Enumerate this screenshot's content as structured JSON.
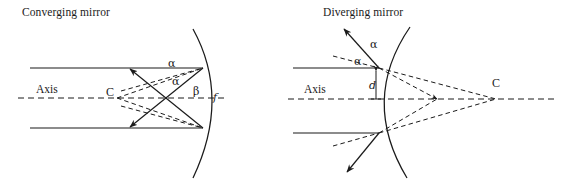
{
  "figure": {
    "background_color": "#ffffff",
    "ink_color": "#1b1b1b",
    "width": 565,
    "height": 187
  },
  "panels": {
    "left": {
      "title": "Converging mirror",
      "axis_label": "Axis",
      "center_label": "C",
      "focus_label": "f",
      "angle_incident_label": "α",
      "angle_normal_label": "α",
      "angle_beta_label": "β",
      "mirror_type": "concave",
      "rays": [
        {
          "name": "upper-parallel-ray",
          "style": "solid",
          "from_x": 30,
          "from_y": 68,
          "to_x": 202,
          "to_y": 68
        },
        {
          "name": "lower-parallel-ray",
          "style": "solid",
          "from_x": 30,
          "from_y": 128,
          "to_x": 202,
          "to_y": 128
        },
        {
          "name": "upper-reflected-ray",
          "style": "solid",
          "from_x": 202,
          "from_y": 68,
          "to_x": 131,
          "to_y": 125
        },
        {
          "name": "lower-reflected-ray",
          "style": "solid",
          "from_x": 202,
          "from_y": 128,
          "to_x": 131,
          "to_y": 71
        },
        {
          "name": "upper-radius-dashed",
          "style": "dashed",
          "from_x": 202,
          "from_y": 68,
          "to_x": 117,
          "to_y": 98
        },
        {
          "name": "lower-radius-dashed",
          "style": "dashed",
          "from_x": 202,
          "from_y": 128,
          "to_x": 117,
          "to_y": 98
        },
        {
          "name": "upper-focus-dashed",
          "style": "dashed",
          "from_x": 202,
          "from_y": 68,
          "to_x": 117,
          "to_y": 98
        },
        {
          "name": "lower-focus-dashed",
          "style": "dashed",
          "from_x": 202,
          "from_y": 128,
          "to_x": 117,
          "to_y": 98
        }
      ]
    },
    "right": {
      "title": "Diverging mirror",
      "axis_label": "Axis",
      "center_label": "C",
      "distance_label": "d",
      "angle_reflected_label": "α",
      "angle_normal_label": "α",
      "mirror_type": "convex",
      "rays": [
        {
          "name": "upper-parallel-ray",
          "style": "solid",
          "from_x": 293,
          "from_y": 68,
          "to_x": 378,
          "to_y": 68
        },
        {
          "name": "lower-parallel-ray",
          "style": "solid",
          "from_x": 293,
          "from_y": 133,
          "to_x": 378,
          "to_y": 133
        },
        {
          "name": "upper-reflected-ray",
          "style": "solid",
          "from_x": 378,
          "from_y": 68,
          "to_x": 345,
          "to_y": 30
        },
        {
          "name": "lower-reflected-ray",
          "style": "solid",
          "from_x": 378,
          "from_y": 133,
          "to_x": 348,
          "to_y": 171
        },
        {
          "name": "upper-virtual-dashed",
          "style": "dashed",
          "from_x": 378,
          "from_y": 68,
          "to_x": 496,
          "to_y": 99
        },
        {
          "name": "lower-virtual-dashed",
          "style": "dashed",
          "from_x": 378,
          "from_y": 133,
          "to_x": 496,
          "to_y": 99
        }
      ]
    }
  }
}
